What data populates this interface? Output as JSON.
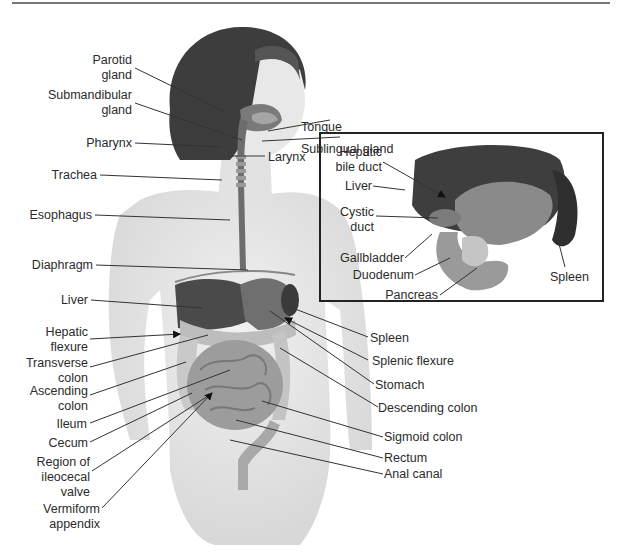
{
  "labels_left": [
    {
      "id": "parotid",
      "text": "Parotid\ngland"
    },
    {
      "id": "submandibular",
      "text": "Submandibular\ngland"
    },
    {
      "id": "pharynx",
      "text": "Pharynx"
    },
    {
      "id": "trachea",
      "text": "Trachea"
    },
    {
      "id": "esophagus",
      "text": "Esophagus"
    },
    {
      "id": "diaphragm",
      "text": "Diaphragm"
    },
    {
      "id": "liver",
      "text": "Liver"
    },
    {
      "id": "hepatic_flexure",
      "text": "Hepatic\nflexure"
    },
    {
      "id": "transverse_colon",
      "text": "Transverse\ncolon"
    },
    {
      "id": "ascending_colon",
      "text": "Ascending\ncolon"
    },
    {
      "id": "ileum",
      "text": "Ileum"
    },
    {
      "id": "cecum",
      "text": "Cecum"
    },
    {
      "id": "ileocecal",
      "text": "Region of\nileocecal\nvalve"
    },
    {
      "id": "appendix",
      "text": "Vermiform\nappendix"
    }
  ],
  "labels_right": [
    {
      "id": "tongue",
      "text": "Tongue"
    },
    {
      "id": "sublingual",
      "text": "Sublingual gland"
    },
    {
      "id": "larynx",
      "text": "Larynx"
    },
    {
      "id": "spleen",
      "text": "Spleen"
    },
    {
      "id": "splenic_flexure",
      "text": "Splenic flexure"
    },
    {
      "id": "stomach",
      "text": "Stomach"
    },
    {
      "id": "descending_colon",
      "text": "Descending colon"
    },
    {
      "id": "sigmoid_colon",
      "text": "Sigmoid colon"
    },
    {
      "id": "rectum",
      "text": "Rectum"
    },
    {
      "id": "anal_canal",
      "text": "Anal canal"
    }
  ],
  "inset_labels": [
    {
      "id": "hepatic_bile_duct",
      "text": "Hepatic\nbile duct"
    },
    {
      "id": "inset_liver",
      "text": "Liver"
    },
    {
      "id": "cystic_duct",
      "text": "Cystic\nduct"
    },
    {
      "id": "gallbladder",
      "text": "Gallbladder"
    },
    {
      "id": "duodenum",
      "text": "Duodenum"
    },
    {
      "id": "pancreas",
      "text": "Pancreas"
    },
    {
      "id": "inset_spleen",
      "text": "Spleen"
    }
  ],
  "colors": {
    "hair": "#3a3a3a",
    "skin": "#e6e6e6",
    "organ_dark": "#4a4a4a",
    "organ_mid": "#8a8a8a",
    "organ_light": "#c4c4c4",
    "leader_line": "#333333",
    "inset_border": "#222222"
  }
}
